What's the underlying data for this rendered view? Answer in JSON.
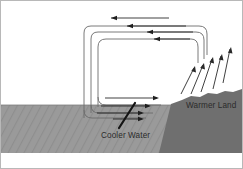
{
  "figure": {
    "frame_border_color": "#b8b8b8",
    "background_color": "#ffffff"
  },
  "labels": {
    "warmer_land": "Warmer Land",
    "cooler_water": "Cooler Water"
  },
  "surfaces": {
    "water": {
      "name": "Cooler Water",
      "fill_color": "#9a9a9a",
      "hatch_color": "#8d8d8d"
    },
    "land": {
      "name": "Warmer Land",
      "fill_color": "#6f6f6f"
    }
  },
  "flow": {
    "loop_stroke_color": "#5a5a5a",
    "arrow_color": "#1f1f1f",
    "loop_count": 3,
    "top_flow_direction": "left",
    "bottom_flow_direction": "right",
    "rising_arrow_count": 5,
    "rising_arrow_direction": "up-left",
    "leader_line_color": "#151515"
  }
}
